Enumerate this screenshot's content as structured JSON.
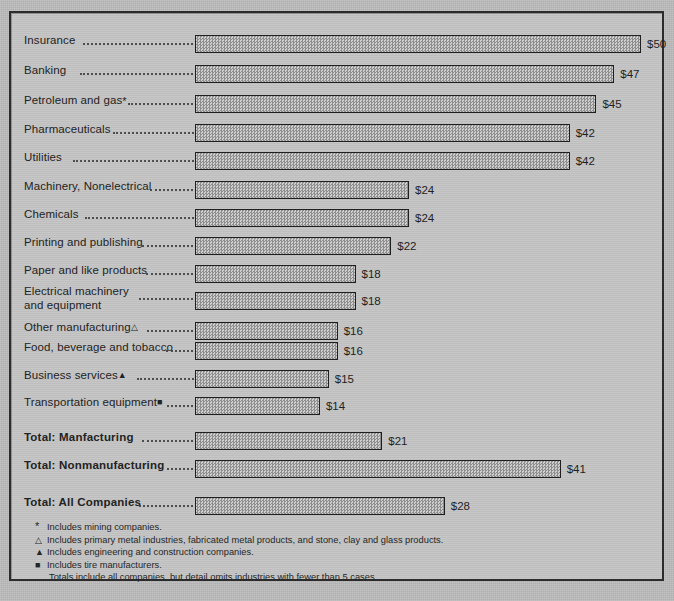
{
  "chart_data": {
    "type": "bar",
    "title": "",
    "subtitle": "",
    "xlabel": "",
    "ylabel": "",
    "orientation": "horizontal",
    "grid": false,
    "legend": "none",
    "value_prefix": "$",
    "xlim": [
      0,
      50
    ],
    "categories": [
      "Insurance",
      "Banking",
      "Petroleum and gas*",
      "Pharmaceuticals",
      "Utilities",
      "Machinery, Nonelectrical",
      "Chemicals",
      "Printing and publishing",
      "Paper and like products",
      "Electrical machinery and equipment",
      "Other manufacturing△",
      "Food, beverage and tobacco",
      "Business services▲",
      "Transportation equipment■",
      "Total:  Manfacturing",
      "Total:  Nonmanufacturing",
      "Total:  All Companies"
    ],
    "values": [
      50,
      47,
      45,
      42,
      42,
      24,
      24,
      22,
      18,
      18,
      16,
      16,
      15,
      14,
      21,
      41,
      28
    ],
    "value_labels": [
      "$50",
      "$47",
      "$45",
      "$42",
      "$42",
      "$24",
      "$24",
      "$22",
      "$18",
      "$18",
      "$16",
      "$16",
      "$15",
      "$14",
      "$21",
      "$41",
      "$28"
    ]
  },
  "rows": [
    {
      "label": "Insurance",
      "label2": "",
      "marker": "",
      "value": 50,
      "value_label": "$50",
      "bold": false,
      "top": 22,
      "leader_start": 72,
      "leader_end": 190
    },
    {
      "label": "Banking",
      "label2": "",
      "marker": "",
      "value": 47,
      "value_label": "$47",
      "bold": false,
      "top": 52,
      "leader_start": 69,
      "leader_end": 190
    },
    {
      "label": "Petroleum and gas",
      "label2": "",
      "marker": "*",
      "value": 45,
      "value_label": "$45",
      "bold": false,
      "top": 82,
      "leader_start": 117,
      "leader_end": 190
    },
    {
      "label": "Pharmaceuticals",
      "label2": "",
      "marker": "",
      "value": 42,
      "value_label": "$42",
      "bold": false,
      "top": 111,
      "leader_start": 102,
      "leader_end": 190
    },
    {
      "label": "Utilities",
      "label2": "",
      "marker": "",
      "value": 42,
      "value_label": "$42",
      "bold": false,
      "top": 139,
      "leader_start": 62,
      "leader_end": 190
    },
    {
      "label": "Machinery, Nonelectrical",
      "label2": "",
      "marker": "",
      "value": 24,
      "value_label": "$24",
      "bold": false,
      "top": 168,
      "leader_start": 139,
      "leader_end": 190
    },
    {
      "label": "Chemicals",
      "label2": "",
      "marker": "",
      "value": 24,
      "value_label": "$24",
      "bold": false,
      "top": 196,
      "leader_start": 74,
      "leader_end": 190
    },
    {
      "label": "Printing and publishing",
      "label2": "",
      "marker": "",
      "value": 22,
      "value_label": "$22",
      "bold": false,
      "top": 224,
      "leader_start": 131,
      "leader_end": 190
    },
    {
      "label": "Paper and like products",
      "label2": "",
      "marker": "",
      "value": 18,
      "value_label": "$18",
      "bold": false,
      "top": 252,
      "leader_start": 135,
      "leader_end": 190
    },
    {
      "label": "Electrical machinery",
      "label2": "and equipment",
      "marker": "",
      "value": 18,
      "value_label": "$18",
      "bold": false,
      "top": 273,
      "leader_start": 128,
      "leader_end": 190
    },
    {
      "label": "Other manufacturing",
      "label2": "",
      "marker": "△",
      "value": 16,
      "value_label": "$16",
      "bold": false,
      "top": 309,
      "leader_start": 136,
      "leader_end": 190
    },
    {
      "label": "Food, beverage and tobacco",
      "label2": "",
      "marker": "",
      "value": 16,
      "value_label": "$16",
      "bold": false,
      "top": 329,
      "leader_start": 155,
      "leader_end": 190
    },
    {
      "label": "Business services",
      "label2": "",
      "marker": "▲",
      "value": 15,
      "value_label": "$15",
      "bold": false,
      "top": 357,
      "leader_start": 126,
      "leader_end": 190
    },
    {
      "label": "Transportation equipment",
      "label2": "",
      "marker": "■",
      "value": 14,
      "value_label": "$14",
      "bold": false,
      "top": 384,
      "leader_start": 156,
      "leader_end": 190
    },
    {
      "label": "Total:  Manfacturing",
      "label2": "",
      "marker": "",
      "value": 21,
      "value_label": "$21",
      "bold": true,
      "top": 419,
      "leader_start": 131,
      "leader_end": 190
    },
    {
      "label": "Total:  Nonmanufacturing",
      "label2": "",
      "marker": "",
      "value": 41,
      "value_label": "$41",
      "bold": true,
      "top": 447,
      "leader_start": 156,
      "leader_end": 190
    },
    {
      "label": "Total:  All Companies",
      "label2": "",
      "marker": "",
      "value": 28,
      "value_label": "$28",
      "bold": true,
      "top": 484,
      "leader_start": 128,
      "leader_end": 190
    }
  ],
  "footnotes": [
    {
      "symbol": "*",
      "text": "Includes mining companies."
    },
    {
      "symbol": "△",
      "text": "Includes primary metal industries, fabricated metal products, and stone, clay and glass products."
    },
    {
      "symbol": "▲",
      "text": "Includes engineering and construction companies."
    },
    {
      "symbol": "■",
      "text": "Includes tire manufacturers."
    },
    {
      "symbol": "",
      "text": "Totals include all companies, but detail  omits industries with fewer than 5 cases."
    }
  ],
  "colors": {
    "page_background": "#bcbcbc",
    "chart_background": "#c4c4c4",
    "frame_border": "#2c2c2c",
    "bar_fill_light": "#cfcfcf",
    "bar_fill_dark": "#8e8e8e",
    "bar_border": "#1f1f1f",
    "text": "#232323"
  }
}
